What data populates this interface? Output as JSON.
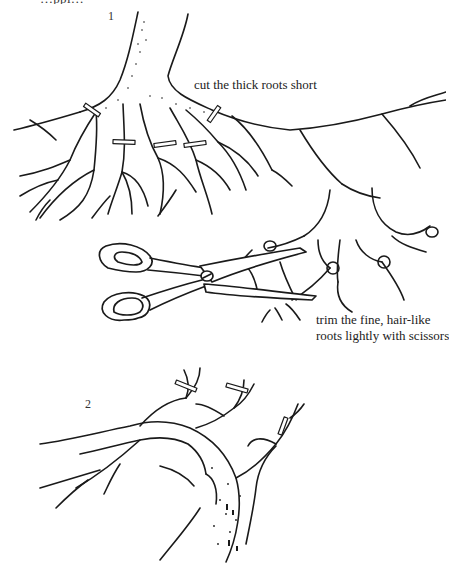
{
  "page": {
    "top_text_cutoff": "…ppi…"
  },
  "figure1": {
    "number": "1",
    "caption_cut": "cut the thick roots short",
    "caption_trim_line1": "trim the fine, hair-like",
    "caption_trim_line2": "roots lightly with scissors"
  },
  "figure2": {
    "number": "2"
  },
  "icons": {
    "scissors": "scissors-illustration",
    "root_ball": "root-ball-illustration",
    "tree": "tree-branch-illustration"
  },
  "colors": {
    "ink": "#1a1a1a",
    "paper": "#ffffff"
  }
}
